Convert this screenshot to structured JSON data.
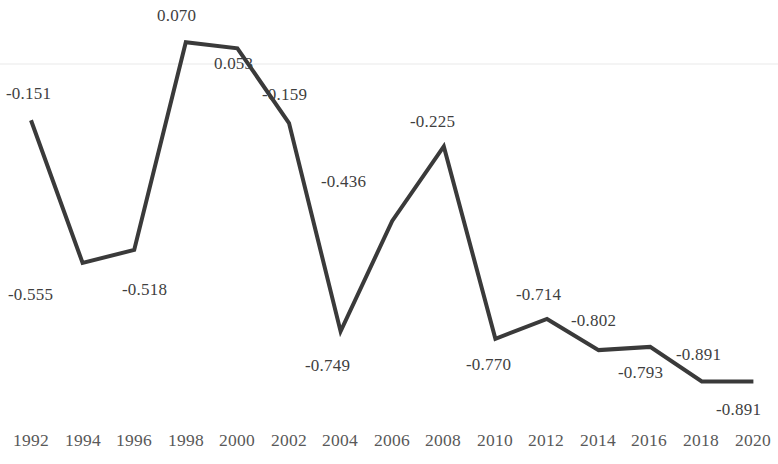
{
  "chart_data": {
    "type": "line",
    "title": "",
    "xlabel": "",
    "ylabel": "",
    "grid": true,
    "gridlines": [
      0.0
    ],
    "legend": "none",
    "ylim": [
      -1.0,
      0.12
    ],
    "xlim": [
      1992,
      2020
    ],
    "categories": [
      "1992",
      "1994",
      "1996",
      "1998",
      "2000",
      "2002",
      "2004",
      "2006",
      "2008",
      "2010",
      "2012",
      "2014",
      "2016",
      "2018",
      "2020"
    ],
    "x": [
      1992,
      1994,
      1996,
      1998,
      2000,
      2002,
      2004,
      2006,
      2008,
      2010,
      2012,
      2014,
      2016,
      2018,
      2020
    ],
    "values": [
      -0.151,
      -0.555,
      -0.518,
      0.07,
      0.053,
      -0.159,
      -0.749,
      -0.436,
      -0.225,
      -0.77,
      -0.714,
      -0.802,
      -0.793,
      -0.891,
      -0.891
    ],
    "point_labels": [
      "-0.151",
      "-0.555",
      "-0.518",
      "0.070",
      "0.053",
      "-0.159",
      "-0.749",
      "-0.436",
      "-0.225",
      "-0.770",
      "-0.714",
      "-0.802",
      "-0.793",
      "-0.891",
      "-0.891"
    ],
    "series": [
      {
        "name": "series-1",
        "color": "#3a3a3a",
        "line_width": 4,
        "values": [
          -0.151,
          -0.555,
          -0.518,
          0.07,
          0.053,
          -0.159,
          -0.749,
          -0.436,
          -0.225,
          -0.77,
          -0.714,
          -0.802,
          -0.793,
          -0.891,
          -0.891
        ]
      }
    ],
    "colors": {
      "line": "#3a3a3a",
      "label_text": "#3f3f3f",
      "tick_text": "#595959",
      "gridline": "#e9e9e9",
      "background": "#ffffff"
    }
  },
  "axis": {
    "ticks": [
      {
        "label": "1992",
        "x": 31
      },
      {
        "label": "1994",
        "x": 83
      },
      {
        "label": "1996",
        "x": 134
      },
      {
        "label": "1998",
        "x": 186
      },
      {
        "label": "2000",
        "x": 237
      },
      {
        "label": "2002",
        "x": 289
      },
      {
        "label": "2004",
        "x": 340
      },
      {
        "label": "2006",
        "x": 392
      },
      {
        "label": "2008",
        "x": 443
      },
      {
        "label": "2010",
        "x": 495
      },
      {
        "label": "2012",
        "x": 546
      },
      {
        "label": "2014",
        "x": 598
      },
      {
        "label": "2016",
        "x": 649
      },
      {
        "label": "2018",
        "x": 701
      },
      {
        "label": "2020",
        "x": 753
      }
    ]
  },
  "labels": [
    {
      "text": "-0.151",
      "x": 6,
      "y": 84
    },
    {
      "text": "-0.555",
      "x": 8,
      "y": 285
    },
    {
      "text": "-0.518",
      "x": 122,
      "y": 280
    },
    {
      "text": "0.070",
      "x": 157,
      "y": 6
    },
    {
      "text": "0.053",
      "x": 214,
      "y": 54
    },
    {
      "text": "-0.159",
      "x": 262,
      "y": 85
    },
    {
      "text": "-0.749",
      "x": 305,
      "y": 356
    },
    {
      "text": "-0.436",
      "x": 321,
      "y": 172
    },
    {
      "text": "-0.225",
      "x": 410,
      "y": 112
    },
    {
      "text": "-0.770",
      "x": 466,
      "y": 355
    },
    {
      "text": "-0.714",
      "x": 516,
      "y": 285
    },
    {
      "text": "-0.802",
      "x": 571,
      "y": 311
    },
    {
      "text": "-0.793",
      "x": 618,
      "y": 363
    },
    {
      "text": "-0.891",
      "x": 676,
      "y": 345
    },
    {
      "text": "-0.891",
      "x": 716,
      "y": 400
    }
  ],
  "geometry": {
    "zero_y": 67,
    "px_per_unit": 353,
    "x_start": 31,
    "x_step": 51.6,
    "gridline_y": 64
  }
}
